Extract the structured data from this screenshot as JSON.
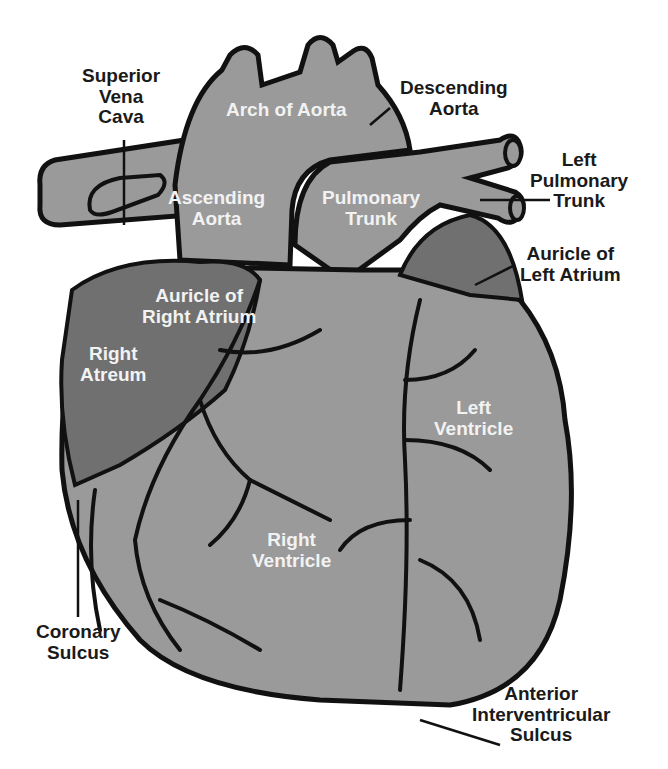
{
  "diagram": {
    "colors": {
      "background": "#ffffff",
      "tissue": "#9a9a9a",
      "atria": "#707070",
      "outline": "#111111",
      "label_dark": "#1a1a1a",
      "label_light": "#f2f2f2"
    },
    "external_labels": {
      "superior_vena_cava": [
        "Superior",
        "Vena",
        "Cava"
      ],
      "descending_aorta": [
        "Descending",
        "Aorta"
      ],
      "left_pulmonary_trunk": [
        "Left",
        "Pulmonary",
        "Trunk"
      ],
      "auricle_left_atrium": [
        "Auricle of",
        "Left Atrium"
      ],
      "coronary_sulcus": [
        "Coronary",
        "Sulcus"
      ],
      "anterior_interventricular_sulcus": [
        "Anterior",
        "Interventricular",
        "Sulcus"
      ]
    },
    "internal_labels": {
      "arch_of_aorta": [
        "Arch of Aorta"
      ],
      "ascending_aorta": [
        "Ascending",
        "Aorta"
      ],
      "pulmonary_trunk": [
        "Pulmonary",
        "Trunk"
      ],
      "auricle_right_atrium": [
        "Auricle of",
        "Right Atrium"
      ],
      "right_atreum": [
        "Right",
        "Atreum"
      ],
      "left_ventricle": [
        "Left",
        "Ventricle"
      ],
      "right_ventricle": [
        "Right",
        "Ventricle"
      ]
    }
  }
}
